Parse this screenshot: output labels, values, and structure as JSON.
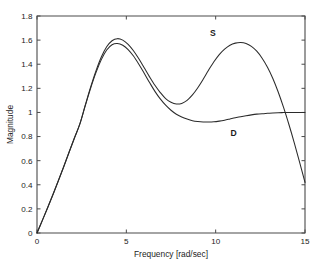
{
  "chart_data": {
    "type": "line",
    "title": "",
    "xlabel": "Frequency [rad/sec]",
    "ylabel": "Magnitude",
    "xlim": [
      0,
      15
    ],
    "ylim": [
      0,
      1.8
    ],
    "xticks": [
      0,
      5,
      10,
      15
    ],
    "xtick_labels": [
      "0",
      "5",
      "10",
      "15"
    ],
    "yticks": [
      0,
      0.2,
      0.4,
      0.6,
      0.8,
      1,
      1.2,
      1.4,
      1.6,
      1.8
    ],
    "ytick_labels": [
      "0",
      "0.2",
      "0.4",
      "0.6",
      "0.8",
      "1",
      "1.2",
      "1.4",
      "1.6",
      "1.8"
    ],
    "grid": false,
    "legend": "inline-annotations",
    "annotations": [
      {
        "text": "S",
        "x": 9.85,
        "y": 1.635
      },
      {
        "text": "D",
        "x": 11.0,
        "y": 0.805
      }
    ],
    "series": [
      {
        "name": "S",
        "color": "#2b2b2b",
        "x": [
          0,
          0.3,
          0.6,
          0.9,
          1.2,
          1.5,
          1.8,
          2.1,
          2.4,
          2.7,
          3.0,
          3.3,
          3.6,
          3.9,
          4.2,
          4.5,
          4.8,
          5.1,
          5.4,
          5.7,
          6.0,
          6.3,
          6.6,
          6.9,
          7.2,
          7.5,
          7.8,
          8.1,
          8.4,
          8.7,
          9.0,
          9.3,
          9.6,
          9.9,
          10.2,
          10.5,
          10.8,
          11.1,
          11.4,
          11.7,
          12.0,
          12.3,
          12.6,
          12.9,
          13.2,
          13.5,
          13.8,
          14.1,
          14.4,
          14.7,
          15.0
        ],
        "y": [
          0.0,
          0.105,
          0.212,
          0.322,
          0.435,
          0.552,
          0.672,
          0.79,
          0.905,
          1.06,
          1.21,
          1.345,
          1.46,
          1.545,
          1.595,
          1.612,
          1.6,
          1.565,
          1.512,
          1.445,
          1.37,
          1.295,
          1.225,
          1.165,
          1.115,
          1.085,
          1.07,
          1.075,
          1.1,
          1.145,
          1.205,
          1.275,
          1.35,
          1.42,
          1.48,
          1.525,
          1.558,
          1.575,
          1.58,
          1.572,
          1.548,
          1.508,
          1.45,
          1.375,
          1.282,
          1.17,
          1.042,
          0.9,
          0.748,
          0.585,
          0.42
        ]
      },
      {
        "name": "D",
        "color": "#2b2b2b",
        "x": [
          0,
          0.3,
          0.6,
          0.9,
          1.2,
          1.5,
          1.8,
          2.1,
          2.4,
          2.7,
          3.0,
          3.3,
          3.6,
          3.9,
          4.2,
          4.5,
          4.8,
          5.1,
          5.4,
          5.7,
          6.0,
          6.3,
          6.6,
          6.9,
          7.2,
          7.5,
          7.8,
          8.1,
          8.4,
          8.7,
          9.0,
          9.3,
          9.6,
          9.9,
          10.2,
          10.5,
          10.8,
          11.1,
          11.4,
          11.7,
          12.0,
          12.3,
          12.6,
          12.9,
          13.2,
          13.5,
          13.8,
          14.1,
          14.4,
          14.7,
          15.0
        ],
        "y": [
          0.0,
          0.105,
          0.212,
          0.322,
          0.435,
          0.552,
          0.672,
          0.79,
          0.905,
          1.055,
          1.2,
          1.33,
          1.438,
          1.518,
          1.562,
          1.572,
          1.558,
          1.522,
          1.468,
          1.4,
          1.325,
          1.248,
          1.175,
          1.112,
          1.06,
          1.018,
          0.985,
          0.962,
          0.945,
          0.932,
          0.925,
          0.921,
          0.92,
          0.922,
          0.928,
          0.936,
          0.946,
          0.956,
          0.965,
          0.973,
          0.98,
          0.986,
          0.99,
          0.993,
          0.996,
          0.998,
          0.999,
          1.0,
          1.0,
          1.0,
          1.0
        ]
      }
    ]
  },
  "plot_box": {
    "left": 37,
    "right": 305,
    "top": 16,
    "bottom": 233
  }
}
